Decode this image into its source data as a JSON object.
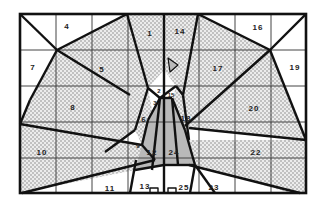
{
  "diagram": {
    "type": "peacock-region-puzzle",
    "grid": {
      "cols": 8,
      "rows": 5
    },
    "frame": {
      "x": 20,
      "y": 14,
      "w": 286,
      "h": 179
    },
    "colors": {
      "line": "#111111",
      "stipple_bg": "#e6e6e6",
      "stipple_dot": "#8a8a8a",
      "body": "#b9b9b9",
      "white": "#ffffff"
    },
    "labels": [
      {
        "id": "1",
        "x": 150,
        "y": 33
      },
      {
        "id": "2",
        "x": 159,
        "y": 91,
        "small": true
      },
      {
        "id": "3",
        "x": 155,
        "y": 103,
        "small": true
      },
      {
        "id": "4",
        "x": 67,
        "y": 26
      },
      {
        "id": "5",
        "x": 102,
        "y": 69
      },
      {
        "id": "6",
        "x": 144,
        "y": 119
      },
      {
        "id": "7",
        "x": 33,
        "y": 67
      },
      {
        "id": "8",
        "x": 73,
        "y": 107
      },
      {
        "id": "9",
        "x": 138,
        "y": 146,
        "small": true
      },
      {
        "id": "10",
        "x": 42,
        "y": 152
      },
      {
        "id": "11",
        "x": 110,
        "y": 188
      },
      {
        "id": "12",
        "x": 152,
        "y": 152
      },
      {
        "id": "13",
        "x": 145,
        "y": 186
      },
      {
        "id": "14",
        "x": 180,
        "y": 31
      },
      {
        "id": "15",
        "x": 171,
        "y": 95,
        "small": true
      },
      {
        "id": "16",
        "x": 258,
        "y": 27
      },
      {
        "id": "17",
        "x": 218,
        "y": 68
      },
      {
        "id": "18",
        "x": 186,
        "y": 118
      },
      {
        "id": "19",
        "x": 295,
        "y": 67
      },
      {
        "id": "20",
        "x": 254,
        "y": 108
      },
      {
        "id": "22",
        "x": 256,
        "y": 152
      },
      {
        "id": "23",
        "x": 214,
        "y": 187
      },
      {
        "id": "24",
        "x": 174,
        "y": 152
      },
      {
        "id": "25",
        "x": 184,
        "y": 187
      }
    ]
  }
}
